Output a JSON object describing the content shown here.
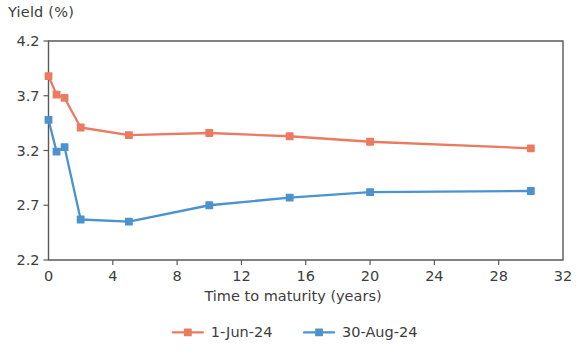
{
  "chart_data": {
    "type": "line",
    "title": "",
    "xlabel": "Time to maturity (years)",
    "ylabel": "Yield (%)",
    "xlim": [
      0,
      32
    ],
    "ylim": [
      2.2,
      4.2
    ],
    "xticks": [
      0,
      4,
      8,
      12,
      16,
      20,
      24,
      28,
      32
    ],
    "xtick_labels": [
      "0",
      "4",
      "8",
      "12",
      "16",
      "20",
      "24",
      "28",
      "32"
    ],
    "yticks": [
      2.2,
      2.7,
      3.2,
      3.7,
      4.2
    ],
    "ytick_labels": [
      "2.2",
      "2.7",
      "3.2",
      "3.7",
      "4.2"
    ],
    "grid": false,
    "legend_position": "bottom",
    "x": [
      0,
      0.5,
      1,
      2,
      5,
      10,
      15,
      20,
      30
    ],
    "series": [
      {
        "name": "1-Jun-24",
        "color": "#ec7a60",
        "values": [
          3.88,
          3.71,
          3.68,
          3.41,
          3.34,
          3.36,
          3.33,
          3.28,
          3.22
        ]
      },
      {
        "name": "30-Aug-24",
        "color": "#4a93ce",
        "values": [
          3.48,
          3.19,
          3.23,
          2.57,
          2.55,
          2.7,
          2.77,
          2.82,
          2.83
        ]
      }
    ]
  },
  "legend": {
    "items": [
      {
        "label": "1-Jun-24",
        "color": "#ec7a60"
      },
      {
        "label": "30-Aug-24",
        "color": "#4a93ce"
      }
    ]
  },
  "axis": {
    "y_axis_title": "Yield (%)",
    "x_axis_title": "Time to maturity (years)"
  }
}
